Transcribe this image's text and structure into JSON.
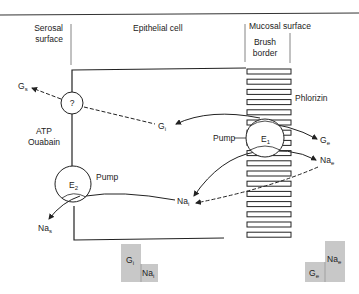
{
  "diagram": {
    "regions": {
      "serosal": [
        "Serosal",
        "surface"
      ],
      "cell": "Epithelial cell",
      "mucosal": "Mucosal surface",
      "brush": [
        "Brush",
        "border"
      ]
    },
    "labels": {
      "gs": {
        "main": "G",
        "sub": "s"
      },
      "gi": {
        "main": "G",
        "sub": "i"
      },
      "ge": {
        "main": "G",
        "sub": "e"
      },
      "nae": {
        "main": "Na",
        "sub": "e"
      },
      "nai": {
        "main": "Na",
        "sub": "i"
      },
      "nas": {
        "main": "Na",
        "sub": "s"
      },
      "unknown": "?",
      "e1": {
        "main": "E",
        "sub": "1"
      },
      "e2": {
        "main": "E",
        "sub": "2"
      },
      "pump1": "Pump",
      "pump2": "Pump",
      "atp": "ATP",
      "ouabain": "Ouabain",
      "phlorizin": "Phlorizin"
    },
    "gradients": {
      "cell": {
        "g": {
          "main": "G",
          "sub": "i"
        },
        "na": {
          "main": "Na",
          "sub": "i"
        }
      },
      "lumen": {
        "g": {
          "main": "G",
          "sub": "e"
        },
        "na": {
          "main": "Na",
          "sub": "e"
        }
      }
    },
    "colors": {
      "line": "#222222",
      "box": "#c8c8c8"
    }
  }
}
